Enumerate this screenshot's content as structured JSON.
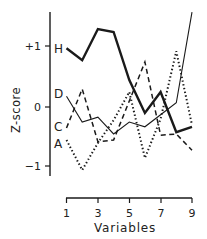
{
  "chart_data": {
    "type": "line",
    "title": "",
    "xlabel": "Variables",
    "ylabel": "Z-score",
    "x": [
      1,
      2,
      3,
      4,
      5,
      6,
      7,
      8,
      9
    ],
    "xticks": [
      "1",
      "3",
      "5",
      "7",
      "9"
    ],
    "yticks": [
      "+1",
      "0",
      "−1"
    ],
    "ylim": [
      -1.5,
      1.6
    ],
    "xlim": [
      1,
      9
    ],
    "grid": false,
    "legend_position": "inline-left",
    "series": [
      {
        "name": "H",
        "style": "thick-solid",
        "values": [
          0.98,
          0.78,
          1.3,
          1.25,
          0.45,
          -0.1,
          0.25,
          -0.42,
          -0.33
        ]
      },
      {
        "name": "D",
        "style": "thin-solid",
        "values": [
          0.18,
          -0.25,
          -0.17,
          -0.45,
          -0.25,
          -0.33,
          -0.13,
          0.07,
          1.58
        ]
      },
      {
        "name": "C",
        "style": "dashed",
        "values": [
          -0.35,
          0.3,
          -0.58,
          -0.55,
          0.1,
          0.75,
          -0.47,
          -0.45,
          -0.72
        ]
      },
      {
        "name": "A",
        "style": "dotted",
        "values": [
          -0.55,
          -1.05,
          -0.6,
          -0.22,
          0.25,
          -0.85,
          -0.2,
          0.93,
          -0.3
        ]
      }
    ]
  },
  "labels": {
    "xlabel": "Variables",
    "ylabel": "Z-score",
    "ytick_plus1": "+1",
    "ytick_0": "0",
    "ytick_minus1": "−1",
    "xtick_1": "1",
    "xtick_3": "3",
    "xtick_5": "5",
    "xtick_7": "7",
    "xtick_9": "9",
    "series_H": "H",
    "series_D": "D",
    "series_C": "C",
    "series_A": "A"
  },
  "colors": {
    "line": "#1a1a1a",
    "background": "#ffffff"
  }
}
